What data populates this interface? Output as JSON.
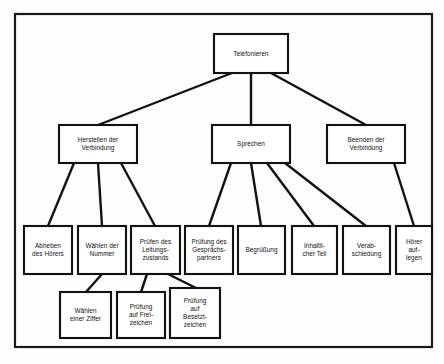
{
  "diagram": {
    "title": "Telefonieren",
    "type": "hierarchy-tree",
    "frame": {
      "x": 14,
      "y": 13,
      "width": 418,
      "height": 334
    },
    "colors": {
      "line": "#121212",
      "box_fill": "#ffffff",
      "background": "#fdfdfc"
    },
    "nodes": [
      {
        "id": "telefonieren",
        "lines": [
          "Telefonieren"
        ],
        "x": 214,
        "y": 34,
        "w": 74,
        "h": 39,
        "level": 0
      },
      {
        "id": "herstellen",
        "lines": [
          "Herstellen der",
          "Verbindung"
        ],
        "x": 59,
        "y": 125,
        "w": 78,
        "h": 38,
        "level": 1
      },
      {
        "id": "sprechen",
        "lines": [
          "Sprechen"
        ],
        "x": 212,
        "y": 125,
        "w": 78,
        "h": 38,
        "level": 1
      },
      {
        "id": "beenden",
        "lines": [
          "Beenden der",
          "Verbindung"
        ],
        "x": 327,
        "y": 125,
        "w": 78,
        "h": 38,
        "level": 1
      },
      {
        "id": "abheben",
        "lines": [
          "Abheben",
          "des Hörers"
        ],
        "x": 24,
        "y": 226,
        "w": 48,
        "h": 48,
        "level": 2
      },
      {
        "id": "waehlen-nummer",
        "lines": [
          "Wählen der",
          "Nummer"
        ],
        "x": 78,
        "y": 226,
        "w": 48,
        "h": 48,
        "level": 2
      },
      {
        "id": "pruefen-leitungszustand",
        "lines": [
          "Prüfen des",
          "Leitungs-",
          "zustands"
        ],
        "x": 131,
        "y": 226,
        "w": 49,
        "h": 48,
        "level": 2
      },
      {
        "id": "pruefung-gespraechspartner",
        "lines": [
          "Prüfung des",
          "Gesprächs-",
          "partners"
        ],
        "x": 185,
        "y": 226,
        "w": 48,
        "h": 48,
        "level": 2
      },
      {
        "id": "begruessung",
        "lines": [
          "Begrüßung"
        ],
        "x": 238,
        "y": 226,
        "w": 47,
        "h": 48,
        "level": 2
      },
      {
        "id": "inhaltlicher-teil",
        "lines": [
          "Inhaltli-",
          "cher Teil"
        ],
        "x": 292,
        "y": 226,
        "w": 45,
        "h": 48,
        "level": 2
      },
      {
        "id": "verabschiedung",
        "lines": [
          "Verab-",
          "schiedung"
        ],
        "x": 343,
        "y": 226,
        "w": 47,
        "h": 48,
        "level": 2
      },
      {
        "id": "hoerer-auflegen",
        "lines": [
          "Hörer",
          "auf-",
          "legen"
        ],
        "x": 396,
        "y": 226,
        "w": 36,
        "h": 48,
        "level": 2
      },
      {
        "id": "waehlen-ziffer",
        "lines": [
          "Wählen",
          "einer Ziffer"
        ],
        "x": 60,
        "y": 292,
        "w": 51,
        "h": 46,
        "level": 3
      },
      {
        "id": "pruefung-freizeichen",
        "lines": [
          "Prüfung",
          "auf Frei-",
          "zeichen"
        ],
        "x": 117,
        "y": 292,
        "w": 48,
        "h": 46,
        "level": 3
      },
      {
        "id": "pruefung-besetztzeichen",
        "lines": [
          "Prüfung",
          "auf",
          "Besetzt-",
          "zeichen"
        ],
        "x": 170,
        "y": 288,
        "w": 50,
        "h": 50,
        "level": 3
      }
    ],
    "edges": [
      {
        "id": "telefonieren-herstellen",
        "from": "telefonieren",
        "to": "herstellen",
        "x1": 232,
        "y1": 73,
        "x2": 98,
        "y2": 125
      },
      {
        "id": "telefonieren-sprechen",
        "from": "telefonieren",
        "to": "sprechen",
        "x1": 251,
        "y1": 73,
        "x2": 251,
        "y2": 125
      },
      {
        "id": "telefonieren-beenden",
        "from": "telefonieren",
        "to": "beenden",
        "x1": 271,
        "y1": 73,
        "x2": 366,
        "y2": 125
      },
      {
        "id": "herstellen-abheben",
        "from": "herstellen",
        "to": "abheben",
        "x1": 74,
        "y1": 163,
        "x2": 48,
        "y2": 226
      },
      {
        "id": "herstellen-waehlen-nummer",
        "from": "herstellen",
        "to": "waehlen-nummer",
        "x1": 98,
        "y1": 163,
        "x2": 102,
        "y2": 226
      },
      {
        "id": "herstellen-pruefen",
        "from": "herstellen",
        "to": "pruefen-leitungszustand",
        "x1": 121,
        "y1": 163,
        "x2": 155,
        "y2": 226
      },
      {
        "id": "waehlen-nummer-ziffer",
        "from": "waehlen-nummer",
        "to": "waehlen-ziffer",
        "x1": 102,
        "y1": 274,
        "x2": 86,
        "y2": 292
      },
      {
        "id": "pruefen-freizeichen",
        "from": "pruefen-leitungszustand",
        "to": "pruefung-freizeichen",
        "x1": 147,
        "y1": 274,
        "x2": 141,
        "y2": 292
      },
      {
        "id": "pruefen-besetztzeichen",
        "from": "pruefen-leitungszustand",
        "to": "pruefung-besetztzeichen",
        "x1": 168,
        "y1": 274,
        "x2": 196,
        "y2": 288
      },
      {
        "id": "sprechen-pruefung-partner",
        "from": "sprechen",
        "to": "pruefung-gespraechspartner",
        "x1": 231,
        "y1": 163,
        "x2": 209,
        "y2": 226
      },
      {
        "id": "sprechen-begruessung",
        "from": "sprechen",
        "to": "begruessung",
        "x1": 251,
        "y1": 163,
        "x2": 261,
        "y2": 226
      },
      {
        "id": "sprechen-inhaltlicher",
        "from": "sprechen",
        "to": "inhaltlicher-teil",
        "x1": 267,
        "y1": 163,
        "x2": 314,
        "y2": 226
      },
      {
        "id": "sprechen-verabschiedung",
        "from": "sprechen",
        "to": "verabschiedung",
        "x1": 285,
        "y1": 163,
        "x2": 366,
        "y2": 226
      },
      {
        "id": "beenden-hoerer",
        "from": "beenden",
        "to": "hoerer-auflegen",
        "x1": 394,
        "y1": 163,
        "x2": 414,
        "y2": 226
      }
    ]
  }
}
